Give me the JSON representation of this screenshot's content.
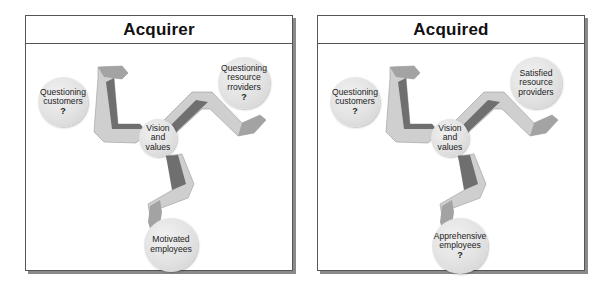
{
  "panels": [
    {
      "title": "Acquirer",
      "center": {
        "lines": [
          "Vision",
          "and",
          "values"
        ]
      },
      "customers": {
        "lines": [
          "Questioning",
          "customers"
        ],
        "mark": "?"
      },
      "resource": {
        "lines": [
          "Questioning",
          "resource",
          "rroviders"
        ],
        "mark": "?"
      },
      "employees": {
        "lines": [
          "Motivated",
          "employees"
        ],
        "mark": ""
      }
    },
    {
      "title": "Acquired",
      "center": {
        "lines": [
          "Vision",
          "and",
          "values"
        ]
      },
      "customers": {
        "lines": [
          "Questioning",
          "customers"
        ],
        "mark": "?"
      },
      "resource": {
        "lines": [
          "Satisfied",
          "resource",
          "providers"
        ],
        "mark": ""
      },
      "employees": {
        "lines": [
          "Apprehensive",
          "employees"
        ],
        "mark": "?"
      }
    }
  ],
  "colors": {
    "leg_light": "#cfcfcf",
    "leg_mid": "#b0b0b0",
    "leg_dark": "#6f6f6f",
    "leg_skin": "#a3a3a3",
    "node_fill": "#e2e2e2",
    "border": "#555555",
    "shadow": "#8a8a8a"
  }
}
